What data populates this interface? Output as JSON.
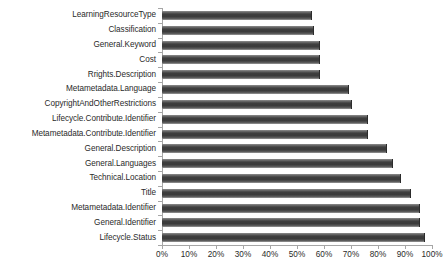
{
  "chart_data": {
    "type": "bar",
    "orientation": "horizontal",
    "title": "",
    "subtitle": "",
    "xlabel": "",
    "ylabel": "",
    "xlim": [
      0,
      100
    ],
    "xticks": [
      0,
      10,
      20,
      30,
      40,
      50,
      60,
      70,
      80,
      90,
      100
    ],
    "xtick_labels": [
      "0%",
      "10%",
      "20%",
      "30%",
      "40%",
      "50%",
      "60%",
      "70%",
      "80%",
      "90%",
      "100%"
    ],
    "grid": false,
    "legend": false,
    "legend_position": "none",
    "bar_color": "#404040",
    "categories": [
      "LearningResourceType",
      "Classification",
      "General.Keyword",
      "Cost",
      "Rrights.Description",
      "Metametadata.Language",
      "CopyrightAndOtherRestrictions",
      "Lifecycle.Contribute.Identifier",
      "Metametadata.Contribute.Identifier",
      "General.Description",
      "General.Languages",
      "Technical.Location",
      "Title",
      "Metametadata.Identifier",
      "General.Identifier",
      "Lifecycle.Status"
    ],
    "values": [
      55,
      56,
      58,
      58,
      58,
      69,
      70,
      76,
      76,
      83,
      85,
      88,
      92,
      95,
      95,
      97
    ]
  }
}
